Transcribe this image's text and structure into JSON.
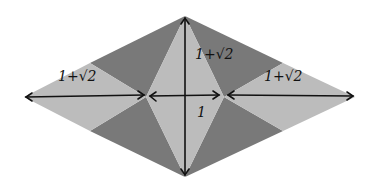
{
  "diagram": {
    "colors": {
      "light": "#bcbcbc",
      "dark": "#797979",
      "ink": "#111111",
      "background": "#ffffff"
    },
    "vertices": {
      "left": [
        24,
        97
      ],
      "right": [
        355,
        97
      ],
      "top": [
        185,
        16
      ],
      "bottom": [
        185,
        177
      ],
      "inner_left": [
        146,
        97
      ],
      "inner_right": [
        224,
        97
      ],
      "edge_ul": [
        90,
        63
      ],
      "edge_ll": [
        90,
        131
      ],
      "edge_ur": [
        283,
        63
      ],
      "edge_lr": [
        283,
        131
      ]
    },
    "labels": {
      "left_segment": "1+√2",
      "top_segment": "1+√2",
      "right_segment": "1+√2",
      "center_segment": "1"
    }
  }
}
